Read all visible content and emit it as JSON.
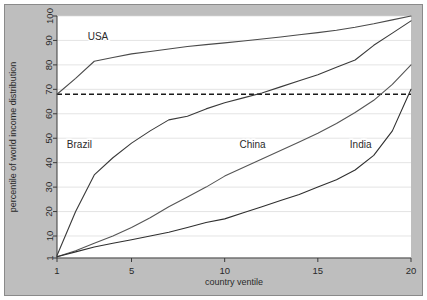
{
  "chart_data": {
    "type": "line",
    "title": "",
    "xlabel": "country ventile",
    "ylabel": "percentile of world income distribution",
    "xlim": [
      1,
      20
    ],
    "ylim": [
      1,
      100
    ],
    "xticks": [
      1,
      5,
      10,
      15,
      20
    ],
    "yticks": [
      1,
      10,
      20,
      30,
      40,
      50,
      60,
      70,
      80,
      90,
      100
    ],
    "grid": true,
    "legend_position": "inline-annotations",
    "reference_line": {
      "label": "",
      "value": 68,
      "style": "dashed",
      "color": "#1a1a1a"
    },
    "x": [
      1,
      2,
      3,
      4,
      5,
      6,
      7,
      8,
      9,
      10,
      11,
      12,
      13,
      14,
      15,
      16,
      17,
      18,
      19,
      20
    ],
    "series": [
      {
        "name": "USA",
        "color": "#4a4a4a",
        "label_x": 3.2,
        "label_y": 90,
        "values": [
          68,
          74.5,
          81.5,
          83,
          84.5,
          85.5,
          86.5,
          87.5,
          88.3,
          89,
          89.8,
          90.6,
          91.4,
          92.3,
          93.2,
          94.2,
          95.4,
          96.8,
          98.4,
          100
        ]
      },
      {
        "name": "Brazil",
        "color": "#3a3a3a",
        "label_x": 2.2,
        "label_y": 46,
        "values": [
          2,
          20,
          35,
          42,
          48,
          53,
          57.5,
          59,
          62,
          64.5,
          66.5,
          68.5,
          71,
          73.5,
          76,
          79,
          82,
          88,
          93,
          98
        ]
      },
      {
        "name": "China",
        "color": "#555555",
        "label_x": 11.5,
        "label_y": 46,
        "values": [
          1.5,
          4,
          7,
          10,
          13.5,
          17.5,
          22,
          26,
          30,
          34.5,
          38,
          41.5,
          45,
          48.5,
          52,
          56,
          60.5,
          65.5,
          72,
          80
        ]
      },
      {
        "name": "India",
        "color": "#2f2f2f",
        "label_x": 17.3,
        "label_y": 46,
        "values": [
          1.5,
          3.5,
          5.5,
          7,
          8.5,
          10,
          11.5,
          13.5,
          15.5,
          17,
          19.5,
          22,
          24.5,
          27,
          30,
          33,
          37,
          43,
          53,
          70
        ]
      }
    ]
  }
}
